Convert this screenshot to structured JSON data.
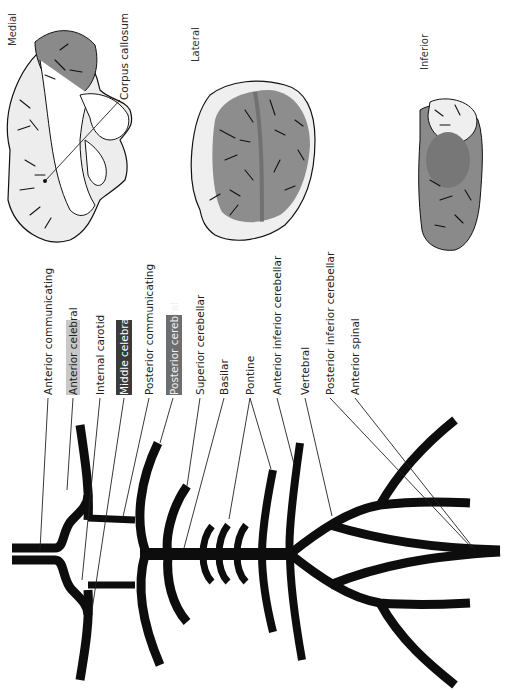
{
  "views": {
    "medial": "Medial",
    "lateral": "Lateral",
    "inferior": "Inferior"
  },
  "annotations": {
    "corpus_callosum": "Corpus callosum"
  },
  "labels": [
    {
      "id": "anterior-communicating",
      "text": "Anterior  communicating",
      "highlight": null
    },
    {
      "id": "anterior-cerebral",
      "text": "Anterior  celebral",
      "highlight": "#c8c8c8"
    },
    {
      "id": "internal-carotid",
      "text": "Internal  carotid",
      "highlight": null
    },
    {
      "id": "middle-cerebral",
      "text": "Middle  celebral",
      "highlight": "#3a3a3a"
    },
    {
      "id": "posterior-communicating",
      "text": "Posterior  communicating",
      "highlight": null
    },
    {
      "id": "posterior-cerebral",
      "text": "Posterior  cerebral",
      "highlight": "#6e6e6e"
    },
    {
      "id": "superior-cerebellar",
      "text": "Superior  cerebellar",
      "highlight": null
    },
    {
      "id": "basilar",
      "text": "Basilar",
      "highlight": null
    },
    {
      "id": "pontine",
      "text": "Pontine",
      "highlight": null
    },
    {
      "id": "anterior-inferior-cerebellar",
      "text": "Anterior  inferior  cerebellar",
      "highlight": null
    },
    {
      "id": "vertebral",
      "text": "Vertebral",
      "highlight": null
    },
    {
      "id": "posterior-inferior-cerebellar",
      "text": "Posterior  inferior  cerebellar",
      "highlight": null
    },
    {
      "id": "anterior-spinal",
      "text": "Anterior  spinal",
      "highlight": null
    }
  ],
  "colors": {
    "anterior_territory": "#c8c8c8",
    "middle_territory": "#3a3a3a",
    "posterior_territory": "#6e6e6e",
    "brain_base": "#efefef",
    "vessel": "#0d0d0d"
  }
}
